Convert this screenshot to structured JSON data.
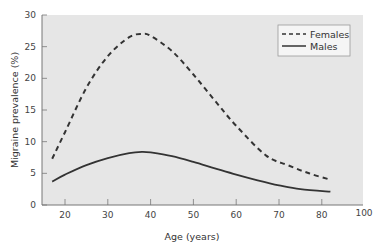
{
  "chart_data": {
    "type": "line",
    "title": "",
    "xlabel": "Age (years)",
    "ylabel": "Migraine prevalence (%)",
    "xlim": [
      15,
      90
    ],
    "ylim": [
      0,
      30
    ],
    "x_ticks": [
      20,
      30,
      40,
      50,
      60,
      70,
      80
    ],
    "x_tick_labels": [
      "20",
      "30",
      "40",
      "50",
      "60",
      "70",
      "80",
      "100"
    ],
    "y_ticks": [
      0,
      5,
      10,
      15,
      20,
      25,
      30
    ],
    "y_tick_labels": [
      "0",
      "5",
      "10",
      "15",
      "20",
      "25",
      "30"
    ],
    "grid": false,
    "legend_position": "upper right",
    "series": [
      {
        "name": "Females",
        "style": "dashed",
        "color": "#333333",
        "x": [
          17,
          20,
          25,
          30,
          35,
          38,
          40,
          45,
          50,
          55,
          60,
          67,
          72,
          77,
          82
        ],
        "y": [
          7.3,
          11.5,
          18.5,
          23.5,
          26.5,
          27.0,
          26.7,
          24.3,
          20.6,
          16.5,
          12.5,
          7.8,
          6.3,
          5.0,
          4.0
        ]
      },
      {
        "name": "Males",
        "style": "solid",
        "color": "#333333",
        "x": [
          17,
          20,
          25,
          30,
          35,
          38,
          40,
          45,
          50,
          55,
          60,
          65,
          70,
          75,
          82
        ],
        "y": [
          3.7,
          4.8,
          6.3,
          7.4,
          8.2,
          8.4,
          8.3,
          7.7,
          6.8,
          5.8,
          4.8,
          3.9,
          3.1,
          2.5,
          2.1
        ]
      }
    ]
  },
  "legend": {
    "females_label": "Females",
    "males_label": "Males"
  },
  "axes": {
    "x_title": "Age (years)",
    "y_title": "Migraine prevalence (%)"
  },
  "colors": {
    "plot_background": "#e6e6e6",
    "line": "#333333",
    "axis": "#666666"
  }
}
